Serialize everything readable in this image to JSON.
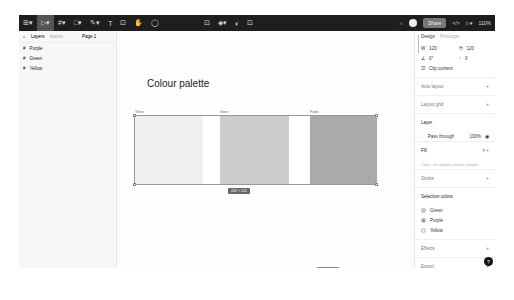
{
  "toolbar": {
    "left_tools": [
      "main-menu",
      "move",
      "frame",
      "shape",
      "pen",
      "text",
      "resources",
      "hand",
      "comment"
    ],
    "share_label": "Share",
    "zoom": "110%"
  },
  "left_panel": {
    "tabs": {
      "layers": "Layers",
      "assets": "Assets"
    },
    "page": "Page 1",
    "layers": [
      "Purple",
      "Green",
      "Yellow"
    ]
  },
  "canvas": {
    "title": "Colour palette",
    "swatches": [
      {
        "label": "Yellow",
        "color": "#efefef"
      },
      {
        "label": "Green",
        "color": "#cccccc"
      },
      {
        "label": "Purple",
        "color": "#aaaaaa"
      }
    ],
    "size_label": "432 × 120"
  },
  "right_panel": {
    "tabs": {
      "design": "Design",
      "prototype": "Prototype"
    },
    "w": "120",
    "h": "120",
    "rotation": "0°",
    "radius": "0",
    "clip_content": "Clip content",
    "auto_layout": "Auto layout",
    "layout_grid": "Layout grid",
    "layer": "Layer",
    "blend": "Pass through",
    "opacity": "100%",
    "fill": "Fill",
    "fill_hint": "Click + to replace mixed content",
    "stroke": "Stroke",
    "selection_colors": "Selection colors",
    "colors": [
      {
        "name": "Green",
        "color": "#cccccc"
      },
      {
        "name": "Purple",
        "color": "#999999"
      },
      {
        "name": "Yellow",
        "color": "#f0f0f0"
      }
    ],
    "effects": "Effects",
    "export": "Export"
  }
}
